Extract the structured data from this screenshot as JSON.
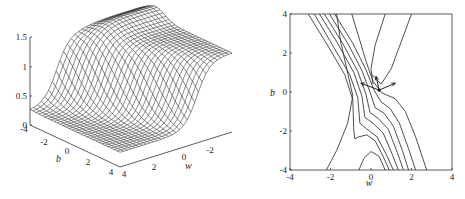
{
  "chart_data": [
    {
      "type": "surface",
      "title": "",
      "xlabel": "w",
      "ylabel": "b",
      "zlabel": "",
      "xlim": [
        -4,
        4
      ],
      "ylim": [
        -4,
        4
      ],
      "zlim": [
        0,
        1.5
      ],
      "x_ticks": [
        "4",
        "2",
        "0",
        "-2",
        "-4"
      ],
      "y_ticks": [
        "-4",
        "-2",
        "0",
        "2",
        "4"
      ],
      "z_ticks": [
        "0",
        "0.5",
        "1",
        "1.5"
      ],
      "description": "Wireframe mesh of an error surface E(w,b) over w,b in [-4,4]: low plateau (~0.25) on one side, rising via a sloped valley/ridge to a high plateau (~1.3-1.4) on the other; narrow trough visible along diagonal.",
      "grid": false
    },
    {
      "type": "contour",
      "title": "",
      "xlabel": "w",
      "ylabel": "b",
      "xlim": [
        -4,
        4
      ],
      "ylim": [
        -4,
        4
      ],
      "x_ticks": [
        "-4",
        "-2",
        "0",
        "2",
        "4"
      ],
      "y_ticks": [
        "-4",
        "-2",
        "0",
        "2",
        "4"
      ],
      "annotations": [
        {
          "type": "point",
          "w": 0.4,
          "b": 0.1
        },
        {
          "type": "arrow",
          "from": [
            0.4,
            0.1
          ],
          "to": [
            -0.5,
            0.45
          ]
        },
        {
          "type": "arrow",
          "from": [
            0.4,
            0.1
          ],
          "to": [
            0.25,
            0.8
          ]
        },
        {
          "type": "arrow",
          "from": [
            0.4,
            0.1
          ],
          "to": [
            1.2,
            0.45
          ]
        }
      ],
      "contour_levels_count": 9
    }
  ],
  "left_plot": {
    "z_ticks": [
      {
        "label": "1.5",
        "y": 37
      },
      {
        "label": "1",
        "y": 67
      },
      {
        "label": "0.5",
        "y": 96
      },
      {
        "label": "0",
        "y": 125
      }
    ],
    "b_ticks": [
      {
        "label": "-4",
        "x": 24,
        "y": 132
      },
      {
        "label": "-2",
        "x": 44,
        "y": 145
      },
      {
        "label": "0",
        "x": 67,
        "y": 154
      },
      {
        "label": "2",
        "x": 88,
        "y": 165
      },
      {
        "label": "4",
        "x": 111,
        "y": 175
      }
    ],
    "w_ticks": [
      {
        "label": "4",
        "x": 124,
        "y": 177
      },
      {
        "label": "2",
        "x": 154,
        "y": 170
      },
      {
        "label": "0",
        "x": 184,
        "y": 160
      },
      {
        "label": "-2",
        "x": 210,
        "y": 153
      }
    ],
    "b_label": {
      "text": "b",
      "x": 56,
      "y": 162
    },
    "w_label": {
      "text": "w",
      "x": 185,
      "y": 169
    }
  },
  "right_plot": {
    "frame": {
      "x": 290,
      "y": 14,
      "w": 162,
      "h": 156
    },
    "x_ticks": [
      "-4",
      "-2",
      "0",
      "2",
      "4"
    ],
    "y_ticks": [
      "4",
      "2",
      "0",
      "-2",
      "-4"
    ],
    "x_label": "w",
    "y_label": "b"
  }
}
